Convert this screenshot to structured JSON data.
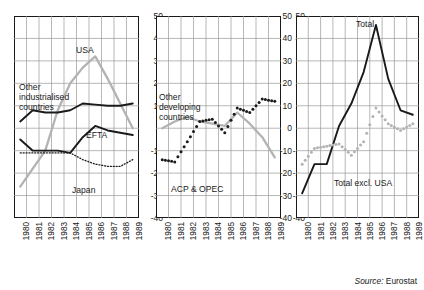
{
  "source_note": {
    "prefix": "Source:",
    "value": "Eurostat"
  },
  "axis": {
    "y_ticks": [
      50,
      40,
      30,
      20,
      10,
      0,
      -10,
      -20,
      -30,
      -40
    ],
    "x_ticks": [
      "1980",
      "1981",
      "1982",
      "1983",
      "1984",
      "1985",
      "1986",
      "1987",
      "1988",
      "1989"
    ],
    "ylim": [
      -40,
      50
    ],
    "xlim": [
      1980,
      1989
    ]
  },
  "colors": {
    "black": "#1a1a1a",
    "grey": "#b3b3b3",
    "grid": "#9a9a9a",
    "background": "#ffffff"
  },
  "labels": {
    "panel1": {
      "usa": "USA",
      "other_industrialised": "Other\nindustrialised\ncountries",
      "efta": "EFTA",
      "japan": "Japan"
    },
    "panel2": {
      "other_developing": "Other\ndeveloping\ncountries",
      "acp_opec": "ACP & OPEC"
    },
    "panel3": {
      "total": "Total",
      "total_excl_usa": "Total excl. USA"
    }
  },
  "chart_data": [
    {
      "type": "line",
      "title": "",
      "panel": 1,
      "xlabel": "",
      "ylabel": "",
      "xlim": [
        1980,
        1989
      ],
      "ylim": [
        -40,
        50
      ],
      "grid": true,
      "x": [
        1980,
        1981,
        1982,
        1983,
        1984,
        1985,
        1986,
        1987,
        1988,
        1989
      ],
      "series": [
        {
          "name": "USA",
          "style": "solid-grey",
          "color": "#b3b3b3",
          "values": [
            -26,
            -18,
            -10,
            8,
            20,
            27,
            32,
            22,
            11,
            0
          ]
        },
        {
          "name": "Other industrialised countries",
          "style": "solid-black",
          "color": "#1a1a1a",
          "values": [
            3,
            8,
            7,
            7,
            8,
            11,
            10.5,
            10,
            10,
            11
          ]
        },
        {
          "name": "EFTA",
          "style": "solid-black",
          "color": "#1a1a1a",
          "values": [
            -5,
            -10,
            -10,
            -10,
            -11,
            -4,
            1,
            -1,
            -2,
            -3
          ]
        },
        {
          "name": "Japan",
          "style": "dotted-black",
          "color": "#1a1a1a",
          "values": [
            -11,
            -11,
            -11,
            -11,
            -11,
            -14,
            -16,
            -17,
            -17,
            -14
          ]
        }
      ]
    },
    {
      "type": "line",
      "title": "",
      "panel": 2,
      "xlabel": "",
      "ylabel": "",
      "xlim": [
        1980,
        1989
      ],
      "ylim": [
        -40,
        50
      ],
      "grid": true,
      "x": [
        1980,
        1981,
        1982,
        1983,
        1984,
        1985,
        1986,
        1987,
        1988,
        1989
      ],
      "series": [
        {
          "name": "Other developing countries",
          "style": "solid-grey",
          "color": "#b3b3b3",
          "values": [
            0,
            3,
            5,
            3,
            2,
            1,
            7,
            2,
            -4,
            -13
          ]
        },
        {
          "name": "ACP & OPEC",
          "style": "dots-black",
          "color": "#1a1a1a",
          "values": [
            -14,
            -15,
            -6,
            3,
            4,
            -2,
            9,
            7,
            13,
            12
          ]
        }
      ]
    },
    {
      "type": "line",
      "title": "",
      "panel": 3,
      "xlabel": "",
      "ylabel": "",
      "xlim": [
        1980,
        1989
      ],
      "ylim": [
        -40,
        50
      ],
      "grid": true,
      "x": [
        1980,
        1981,
        1982,
        1983,
        1984,
        1985,
        1986,
        1987,
        1988,
        1989
      ],
      "series": [
        {
          "name": "Total",
          "style": "solid-black",
          "color": "#1a1a1a",
          "values": [
            -29,
            -16,
            -16,
            1,
            11,
            25,
            46,
            22,
            8,
            6
          ]
        },
        {
          "name": "Total excl. USA",
          "style": "dots-grey",
          "color": "#b3b3b3",
          "values": [
            -16,
            -9,
            -8,
            -7,
            -12,
            -6,
            9,
            2,
            -1,
            2
          ]
        }
      ]
    }
  ]
}
